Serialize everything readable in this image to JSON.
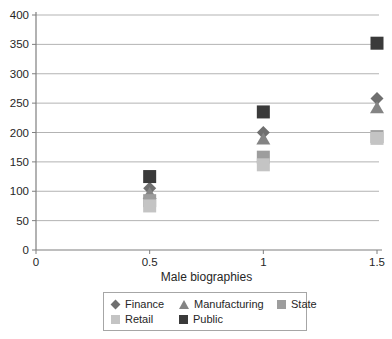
{
  "chart_data": {
    "type": "scatter",
    "title": "",
    "xlabel": "Male biographies",
    "ylabel": "",
    "xlim": [
      0,
      1.5
    ],
    "ylim": [
      0,
      400
    ],
    "x_ticks": [
      "0",
      "0.5",
      "1",
      "1.5"
    ],
    "x_tick_values": [
      0,
      0.5,
      1,
      1.5
    ],
    "y_ticks": [
      "0",
      "50",
      "100",
      "150",
      "200",
      "250",
      "300",
      "350",
      "400"
    ],
    "y_tick_values": [
      0,
      50,
      100,
      150,
      200,
      250,
      300,
      350,
      400
    ],
    "grid": "horizontal",
    "legend_position": "bottom",
    "x": [
      0.5,
      1,
      1.5
    ],
    "series": [
      {
        "name": "Finance",
        "marker": "diamond",
        "color": "#6f6f6f",
        "values": [
          105,
          200,
          258
        ]
      },
      {
        "name": "Manufacturing",
        "marker": "triangle",
        "color": "#848484",
        "values": [
          97,
          190,
          243
        ]
      },
      {
        "name": "State",
        "marker": "square",
        "color": "#9d9d9d",
        "values": [
          84,
          158,
          193
        ]
      },
      {
        "name": "Retail",
        "marker": "square",
        "color": "#c4c4c4",
        "values": [
          75,
          145,
          190
        ]
      },
      {
        "name": "Public",
        "marker": "square",
        "color": "#3a3a3a",
        "values": [
          125,
          235,
          352
        ]
      }
    ],
    "legend_rows": [
      [
        "Finance",
        "Manufacturing",
        "State"
      ],
      [
        "Retail",
        "Public"
      ]
    ]
  },
  "style": {
    "gridline_color": "#b3b3b3",
    "axis_color": "#7f7f7f",
    "text_color": "#262626",
    "background": "#ffffff"
  }
}
